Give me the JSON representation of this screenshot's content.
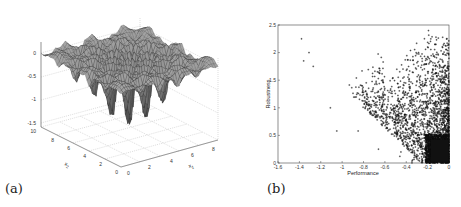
{
  "figure": {
    "panels": [
      {
        "id": "a",
        "caption": "(a)"
      },
      {
        "id": "b",
        "caption": "(b)"
      }
    ]
  },
  "chart_data": [
    {
      "type": "surface3d",
      "title": "",
      "caption": "(a)",
      "xlabel": "x1",
      "ylabel": "x2",
      "zlabel": "",
      "x_ticks": [
        "0",
        "2",
        "4",
        "6",
        "8"
      ],
      "y_ticks": [
        "0",
        "2",
        "4",
        "6",
        "8",
        "10"
      ],
      "z_ticks": [
        "0",
        "-0.5",
        "-1",
        "-1.5"
      ],
      "xlim": [
        0,
        10
      ],
      "ylim": [
        0,
        10
      ],
      "zlim": [
        -1.7,
        0.2
      ],
      "grid": true,
      "description": "Multimodal oscillating surface with flat plateau near 0 at edges and deep narrow spikes down to about -1.7 near the center (x1≈5, x2≈5)"
    },
    {
      "type": "scatter",
      "title": "",
      "caption": "(b)",
      "xlabel": "Performance",
      "ylabel": "Robustness",
      "x_ticks": [
        "-1.6",
        "-1.4",
        "-1.2",
        "-1",
        "-0.8",
        "-0.6",
        "-0.4",
        "-0.2",
        "0"
      ],
      "y_ticks": [
        "0",
        "0.5",
        "1",
        "1.5",
        "2",
        "2.5"
      ],
      "xlim": [
        -1.6,
        0
      ],
      "ylim": [
        0,
        2.5
      ],
      "grid": false,
      "marker": "+",
      "outliers": [
        {
          "x": -1.38,
          "y": 2.25
        },
        {
          "x": -1.31,
          "y": 2.0
        },
        {
          "x": -1.36,
          "y": 1.85
        },
        {
          "x": -1.27,
          "y": 1.75
        },
        {
          "x": -1.11,
          "y": 1.0
        },
        {
          "x": -1.05,
          "y": 0.58
        },
        {
          "x": -0.85,
          "y": 0.58
        },
        {
          "x": -0.66,
          "y": 0.25
        },
        {
          "x": -0.46,
          "y": 0.12
        },
        {
          "x": -0.45,
          "y": 0.2
        }
      ],
      "density_description": "Thousands of points; sparse band from x≈-1.1 to -0.6 at y 1.0–2.3, increasingly dense toward x→0; very dense black cluster at x -0.2..0, y 0..0.5"
    }
  ]
}
